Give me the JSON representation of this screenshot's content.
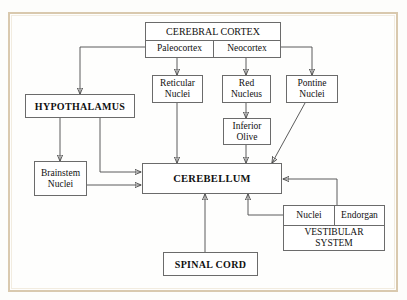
{
  "diagram": {
    "nodes": {
      "cerebral_cortex": "CEREBRAL CORTEX",
      "paleocortex": "Paleocortex",
      "neocortex": "Neocortex",
      "reticular_nuclei_1": "Reticular",
      "reticular_nuclei_2": "Nuclei",
      "red_nucleus_1": "Red",
      "red_nucleus_2": "Nucleus",
      "pontine_nuclei_1": "Pontine",
      "pontine_nuclei_2": "Nuclei",
      "inferior_olive_1": "Inferior",
      "inferior_olive_2": "Olive",
      "hypothalamus": "HYPOTHALAMUS",
      "brainstem_nuclei_1": "Brainstem",
      "brainstem_nuclei_2": "Nuclei",
      "cerebellum": "CEREBELLUM",
      "spinal_cord": "SPINAL CORD",
      "vestibular_nuclei": "Nuclei",
      "vestibular_endorgan": "Endorgan",
      "vestibular_system_1": "VESTIBULAR",
      "vestibular_system_2": "SYSTEM"
    },
    "colors": {
      "frame": "#d9c9ae",
      "box_border": "#6b6b6b",
      "wire": "#4a4a4a",
      "background": "#fefefd",
      "text": "#111111"
    }
  }
}
